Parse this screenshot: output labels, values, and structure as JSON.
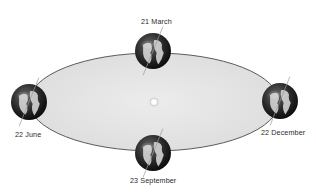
{
  "diagram": {
    "colors": {
      "orbit_fill": "#e6e6e6",
      "orbit_stroke": "#555555",
      "globe_dark": "#1a1a1a",
      "globe_land": "#d8d8d8",
      "sun": "#ffffff",
      "label": "#2a2a2a"
    },
    "orbit": {
      "cx": 154,
      "cy": 102,
      "rx": 125,
      "ry": 49
    },
    "sun": {
      "cx": 154,
      "cy": 102,
      "r": 3.5,
      "icon": "sun-icon"
    },
    "positions": [
      {
        "id": "march",
        "label": "21 March",
        "cx": 153,
        "cy": 51,
        "r": 18,
        "icon": "earth-globe-icon"
      },
      {
        "id": "june",
        "label": "22 June",
        "cx": 29,
        "cy": 102,
        "r": 18,
        "icon": "earth-globe-icon"
      },
      {
        "id": "december",
        "label": "22 December",
        "cx": 280,
        "cy": 101,
        "r": 18,
        "icon": "earth-globe-icon"
      },
      {
        "id": "september",
        "label": "23 September",
        "cx": 153,
        "cy": 153,
        "r": 18,
        "icon": "earth-globe-icon"
      }
    ]
  }
}
